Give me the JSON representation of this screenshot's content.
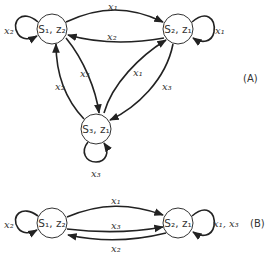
{
  "diagrams": [
    {
      "id": "A",
      "label": "(A)",
      "nodes": [
        {
          "name": "S1,z2",
          "text": "S₁, z₂"
        },
        {
          "name": "S2,z1",
          "text": "S₂, z₁"
        },
        {
          "name": "S3,z1",
          "text": "S₃, z₁"
        }
      ],
      "edges": [
        {
          "from": "S1,z2",
          "to": "S1,z2",
          "label": "x₂"
        },
        {
          "from": "S1,z2",
          "to": "S2,z1",
          "label": "x₁"
        },
        {
          "from": "S2,z1",
          "to": "S1,z2",
          "label": "x₂"
        },
        {
          "from": "S2,z1",
          "to": "S2,z1",
          "label": "x₁"
        },
        {
          "from": "S1,z2",
          "to": "S3,z1",
          "label": "x₃"
        },
        {
          "from": "S3,z1",
          "to": "S1,z2",
          "label": "x₂"
        },
        {
          "from": "S3,z1",
          "to": "S2,z1",
          "label": "x₁"
        },
        {
          "from": "S2,z1",
          "to": "S3,z1",
          "label": "x₃"
        },
        {
          "from": "S3,z1",
          "to": "S3,z1",
          "label": "x₃"
        }
      ]
    },
    {
      "id": "B",
      "label": "(B)",
      "nodes": [
        {
          "name": "S1,z2",
          "text": "S₁, z₂"
        },
        {
          "name": "S2,z1",
          "text": "S₂, z₁"
        }
      ],
      "edges": [
        {
          "from": "S1,z2",
          "to": "S1,z2",
          "label": "x₂"
        },
        {
          "from": "S1,z2",
          "to": "S2,z1",
          "label": "x₁"
        },
        {
          "from": "S1,z2",
          "to": "S2,z1",
          "label": "x₃"
        },
        {
          "from": "S2,z1",
          "to": "S1,z2",
          "label": "x₂"
        },
        {
          "from": "S2,z1",
          "to": "S2,z1",
          "label": "x₁, x₃"
        }
      ]
    }
  ]
}
